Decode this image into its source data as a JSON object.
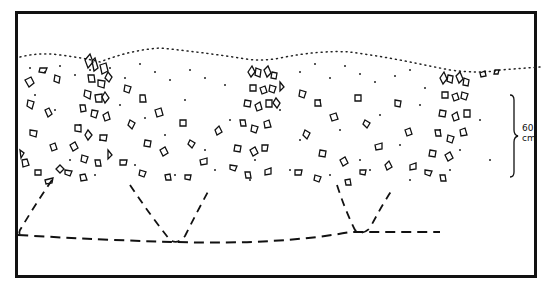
{
  "figure": {
    "type": "soil section drawing",
    "frame": {
      "left": 15,
      "top": 11,
      "right": 536,
      "bottom": 277,
      "stroke": "#111111"
    },
    "scale_bar": {
      "value": "60",
      "unit": "cm",
      "top": 95,
      "bottom": 176,
      "x": 514
    },
    "surface_line": "dotted",
    "base_line": "dashed",
    "pits": 3,
    "caption": ""
  }
}
